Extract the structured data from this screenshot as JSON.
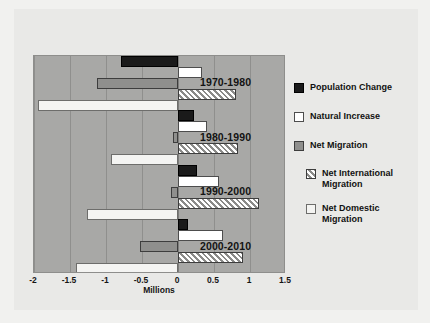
{
  "chart_data": {
    "type": "bar",
    "orientation": "horizontal",
    "title": "",
    "xlabel": "Millions",
    "ylabel": "",
    "xlim": [
      -2,
      1.5
    ],
    "xticks": [
      "-2",
      "-1.5",
      "-1",
      "-0.5",
      "0",
      "0.5",
      "1",
      "1.5"
    ],
    "xtick_values": [
      -2,
      -1.5,
      -1,
      -0.5,
      0,
      0.5,
      1,
      1.5
    ],
    "grid": true,
    "legend_position": "right",
    "categories": [
      "1970-1980",
      "1980-1990",
      "1990-2000",
      "2000-2010"
    ],
    "series": [
      {
        "name": "Population Change",
        "key": "popchange",
        "color": "#1a1a1a",
        "values": [
          -0.79,
          0.22,
          0.27,
          0.14
        ]
      },
      {
        "name": "Natural Increase",
        "key": "natural",
        "color": "#ffffff",
        "values": [
          0.34,
          0.4,
          0.57,
          0.62
        ]
      },
      {
        "name": "Net Migration",
        "key": "netmig",
        "color": "#8f8f8d",
        "values": [
          -1.13,
          -0.07,
          -0.1,
          -0.53
        ]
      },
      {
        "name": "Net International Migration",
        "key": "netintl",
        "color": "#hatch",
        "values": [
          0.8,
          0.83,
          1.13,
          0.9
        ]
      },
      {
        "name": "Net Domestic Migration",
        "key": "netdom",
        "color": "#f4f4f2",
        "values": [
          -1.95,
          -0.93,
          -1.27,
          -1.41
        ]
      }
    ]
  },
  "legend": {
    "entries": [
      {
        "label": "Population Change",
        "swatch": "popchange"
      },
      {
        "label": "Natural Increase",
        "swatch": "natural"
      },
      {
        "label": "Net Migration",
        "swatch": "netmig"
      },
      {
        "label": "Net International Migration",
        "swatch": "netintl"
      },
      {
        "label": "Net Domestic Migration",
        "swatch": "netdom"
      }
    ]
  },
  "colors": {
    "page_background": "#f1f1ef",
    "card_background": "#e9e9e7",
    "plot_background": "#a8a8a6",
    "gridline": "#8f8f8d",
    "text": "#131313"
  }
}
